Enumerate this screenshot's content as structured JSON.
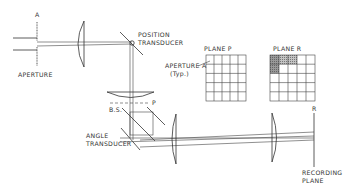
{
  "diagram": {
    "type": "optical-system-schematic",
    "labels": {
      "aperture_mark": "A",
      "aperture": "APERTURE",
      "position_transducer_1": "POSITION",
      "position_transducer_2": "TRANSDUCER",
      "plane_p": "PLANE  P",
      "plane_r": "PLANE  R",
      "aperture_a_1": "APERTURE A",
      "aperture_a_2": "(Typ.)",
      "p_mark": "P",
      "bs": "B.S.",
      "angle_transducer_1": "ANGLE",
      "angle_transducer_2": "TRANSDUCER",
      "r_mark": "R",
      "recording_plane_1": "RECORDING",
      "recording_plane_2": "PLANE"
    },
    "grids": {
      "plane_p": {
        "rows": 5,
        "cols": 5,
        "shaded_cells": []
      },
      "plane_r": {
        "rows": 5,
        "cols": 5,
        "shaded_cells": [
          [
            0,
            0
          ],
          [
            0,
            1
          ],
          [
            0,
            2
          ],
          [
            1,
            0
          ]
        ]
      }
    },
    "colors": {
      "line": "#333333",
      "shade_dark": "#8a8a8a",
      "shade_light": "#b8b8b8",
      "background": "#ffffff"
    }
  }
}
